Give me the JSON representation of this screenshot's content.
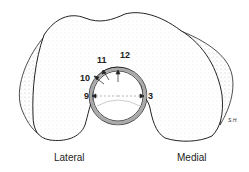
{
  "figure": {
    "labels": {
      "left": "Lateral",
      "right": "Medial"
    },
    "clock_positions": [
      "9",
      "10",
      "11",
      "12",
      "3"
    ],
    "signature": "S.H."
  }
}
